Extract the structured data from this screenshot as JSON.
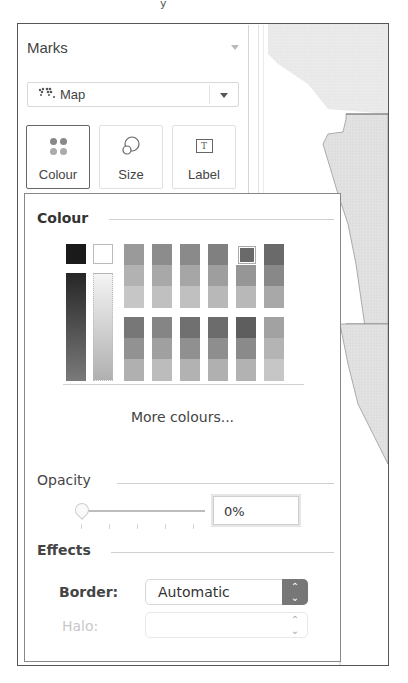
{
  "stray_text": "y",
  "marks": {
    "title": "Marks",
    "mark_type": {
      "icon": "map-icon",
      "label": "Map"
    },
    "cards": [
      {
        "label": "Colour",
        "icon": "colour-dots-icon",
        "active": true
      },
      {
        "label": "Size",
        "icon": "size-circles-icon",
        "active": false
      },
      {
        "label": "Label",
        "icon": "label-text-icon",
        "active": false,
        "glyph": "T"
      }
    ]
  },
  "colour_popup": {
    "colour_section": "Colour",
    "palette": {
      "black_swatch": "#1a1a1a",
      "white_swatch": "#ffffff",
      "gray_ramp": [
        "#2a2a2a",
        "#3a3a3a",
        "#4a4a4a",
        "#5a5a5a",
        "#6a6a6a",
        "#7a7a7a"
      ],
      "light_ramp": [
        "#f0f0f0",
        "#e6e6e6",
        "#d8d8d8",
        "#c8c8c8",
        "#bcbcbc",
        "#b0b0b0"
      ],
      "top_groups": [
        [
          "#9a9a9a",
          "#b2b2b2",
          "#c6c6c6"
        ],
        [
          "#8c8c8c",
          "#a8a8a8",
          "#c0c0c0"
        ],
        [
          "#8a8a8a",
          "#a6a6a6",
          "#c0c0c0"
        ],
        [
          "#808080",
          "#9e9e9e",
          "#b8b8b8"
        ],
        [
          "#6e6e6e",
          "#969696",
          "#b8b8b8"
        ],
        [
          "#6a6a6a",
          "#888888",
          "#a8a8a8"
        ]
      ],
      "bottom_groups": [
        [
          "#777777",
          "#929292",
          "#b0b0b0"
        ],
        [
          "#858585",
          "#a0a0a0",
          "#bcbcbc"
        ],
        [
          "#707070",
          "#909090",
          "#b2b2b2"
        ],
        [
          "#6c6c6c",
          "#8e8e8e",
          "#b0b0b0"
        ],
        [
          "#5e5e5e",
          "#8a8a8a",
          "#b2b2b2"
        ],
        [
          "#a2a2a2",
          "#b4b4b4",
          "#c6c6c6"
        ]
      ],
      "selected_group": 4
    },
    "more_colours": "More colours...",
    "opacity_section": "Opacity",
    "opacity_value": "0%",
    "effects_section": "Effects",
    "border_label": "Border:",
    "border_value": "Automatic",
    "halo_label": "Halo:",
    "halo_value": ""
  }
}
